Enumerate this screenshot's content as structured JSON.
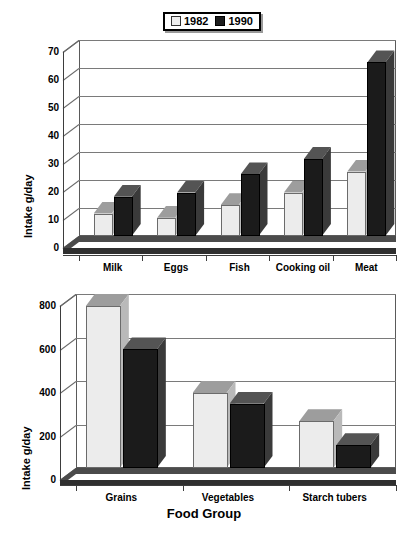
{
  "legend": {
    "entries": [
      {
        "label": "1982",
        "swatch": "light-swatch",
        "color": "#eeeeee"
      },
      {
        "label": "1990",
        "swatch": "dark-swatch",
        "color": "#1d1d1d"
      }
    ]
  },
  "xaxis_title": "Food Group",
  "caption_fragment": "",
  "chart_data": [
    {
      "type": "bar",
      "id": "animal-foods-chart",
      "title": "",
      "xlabel": "",
      "ylabel": "Intake g/day",
      "categories": [
        "Milk",
        "Eggs",
        "Fish",
        "Cooking oil",
        "Meat"
      ],
      "series": [
        {
          "name": "1982",
          "values": [
            8,
            6.5,
            11,
            15.5,
            23
          ]
        },
        {
          "name": "1990",
          "values": [
            14,
            15.5,
            22,
            27.5,
            62
          ]
        }
      ],
      "ylim": [
        0,
        70
      ],
      "yticks": [
        0,
        10,
        20,
        30,
        40,
        50,
        60,
        70
      ],
      "grid": true,
      "legend_position": "top-center",
      "style": "3d-column"
    },
    {
      "type": "bar",
      "id": "plant-foods-chart",
      "title": "",
      "xlabel": "Food Group",
      "ylabel": "Intake g/day",
      "categories": [
        "Grains",
        "Vegetables",
        "Starch tubers"
      ],
      "series": [
        {
          "name": "1982",
          "values": [
            745,
            345,
            215
          ]
        },
        {
          "name": "1990",
          "values": [
            545,
            295,
            105
          ]
        }
      ],
      "ylim": [
        0,
        800
      ],
      "yticks": [
        0,
        200,
        400,
        600,
        800
      ],
      "grid": true,
      "legend_position": "shared-top",
      "style": "3d-column"
    }
  ]
}
